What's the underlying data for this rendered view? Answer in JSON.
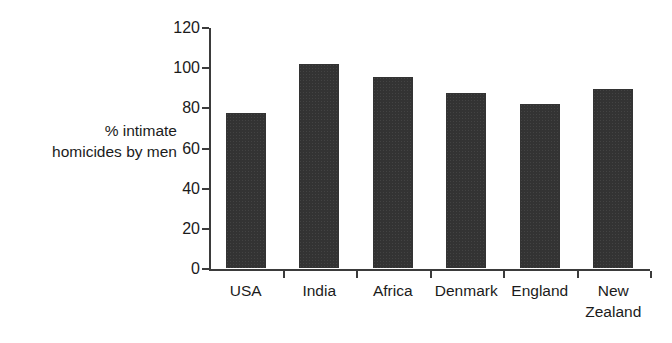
{
  "chart_data": {
    "type": "bar",
    "title": "",
    "xlabel": "",
    "ylabel": "% intimate homicides by men",
    "ylabel_lines": [
      "% intimate",
      "homicides by men"
    ],
    "categories": [
      "USA",
      "India",
      "Africa",
      "Denmark",
      "England",
      "New Zealand"
    ],
    "category_lines": [
      [
        "USA"
      ],
      [
        "India"
      ],
      [
        "Africa"
      ],
      [
        "Denmark"
      ],
      [
        "England"
      ],
      [
        "New",
        "Zealand"
      ]
    ],
    "values": [
      77,
      101.5,
      95,
      87,
      81.5,
      89
    ],
    "ylim": [
      0,
      120
    ],
    "yticks": [
      0,
      20,
      40,
      60,
      80,
      100,
      120
    ],
    "ytick_labels": [
      "0",
      "20",
      "40",
      "60",
      "80",
      "100",
      "120"
    ],
    "grid": false,
    "legend": false,
    "bar_color": "#333333",
    "axis_color": "#3b3b3b",
    "background": "#ffffff"
  }
}
